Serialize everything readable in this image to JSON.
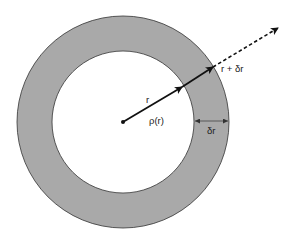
{
  "diagram": {
    "type": "concentric-shell",
    "colors": {
      "background": "#ffffff",
      "shell_fill": "#a9a9a9",
      "inner_fill": "#ffffff",
      "stroke": "#333333",
      "arrow": "#111111"
    },
    "labels": {
      "radius": "r",
      "density": "ρ(r)",
      "shell_thickness": "δr",
      "outer_radius": "r + δr"
    }
  }
}
